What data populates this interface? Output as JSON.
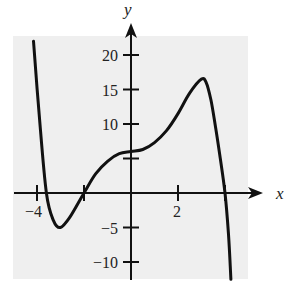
{
  "chart_data": {
    "type": "line",
    "title": "",
    "xlabel": "x",
    "ylabel": "y",
    "xlim": [
      -4.9,
      4.9
    ],
    "ylim": [
      -12.5,
      22.5
    ],
    "grid": false,
    "legend": null,
    "x_ticks": [
      {
        "value": -4,
        "label": "−4"
      },
      {
        "value": -2,
        "label": ""
      },
      {
        "value": 2,
        "label": "2"
      },
      {
        "value": 4,
        "label": ""
      }
    ],
    "y_ticks": [
      {
        "value": 20,
        "label": "20"
      },
      {
        "value": 15,
        "label": "15"
      },
      {
        "value": 10,
        "label": "10"
      },
      {
        "value": 5,
        "label": ""
      },
      {
        "value": -5,
        "label": "−5"
      },
      {
        "value": -10,
        "label": "−10"
      }
    ],
    "series": [
      {
        "name": "f(x)",
        "color": "#111111",
        "x": [
          -4.15,
          -3.9,
          -3.6,
          -3.3,
          -3.0,
          -2.6,
          -2.0,
          -1.5,
          -1.0,
          -0.5,
          0.0,
          0.5,
          1.0,
          1.5,
          2.0,
          2.5,
          3.0,
          3.2,
          3.4,
          3.6,
          3.8,
          4.0,
          4.15,
          4.25
        ],
        "y": [
          22.0,
          11.0,
          0.0,
          -4.0,
          -5.0,
          -3.5,
          0.0,
          2.8,
          4.6,
          5.7,
          6.0,
          6.3,
          7.3,
          9.0,
          11.5,
          14.5,
          16.5,
          16.0,
          13.5,
          9.5,
          5.0,
          0.0,
          -6.0,
          -12.5
        ]
      }
    ]
  },
  "colors": {
    "background": "#ffffff",
    "plot_area": "#efefef",
    "axis": "#111111",
    "curve": "#111111"
  }
}
